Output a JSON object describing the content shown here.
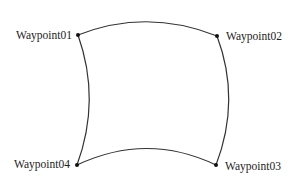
{
  "diagram": {
    "type": "waypoint-route",
    "waypoints": [
      {
        "label": "Waypoint01",
        "x": 78,
        "y": 35
      },
      {
        "label": "Waypoint02",
        "x": 217,
        "y": 36
      },
      {
        "label": "Waypoint03",
        "x": 216,
        "y": 165
      },
      {
        "label": "Waypoint04",
        "x": 77,
        "y": 165
      }
    ],
    "edges": [
      {
        "from": "Waypoint01",
        "to": "Waypoint02",
        "curve": "arc-up"
      },
      {
        "from": "Waypoint02",
        "to": "Waypoint03",
        "curve": "arc-right"
      },
      {
        "from": "Waypoint03",
        "to": "Waypoint04",
        "curve": "arc-up"
      },
      {
        "from": "Waypoint04",
        "to": "Waypoint01",
        "curve": "arc-right"
      }
    ],
    "colors": {
      "line": "#333333",
      "point": "#111111",
      "text": "#222222",
      "background": "#ffffff"
    }
  }
}
